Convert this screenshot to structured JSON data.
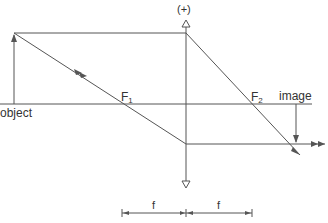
{
  "diagram": {
    "type": "thin-lens ray diagram (converging lens, real inverted image)",
    "colors": {
      "line": "#555555",
      "text": "#333333",
      "background": "#ffffff"
    },
    "lens": {
      "label": "(+)",
      "x": 186,
      "y_top": 20,
      "y_bottom": 186
    },
    "optical_axis": {
      "y": 104,
      "x_start": 0,
      "x_end": 312
    },
    "object": {
      "label": "object",
      "x": 14,
      "y_base": 104,
      "y_tip": 33
    },
    "image": {
      "label": "image",
      "x": 296,
      "y_base": 104,
      "y_tip": 144
    },
    "focal_points": [
      {
        "name": "F",
        "sub": "1",
        "x": 125
      },
      {
        "name": "F",
        "sub": "2",
        "x": 252
      }
    ],
    "rays": [
      {
        "name": "parallel-ray",
        "points": [
          [
            14,
            33
          ],
          [
            186,
            33
          ],
          [
            300,
            155
          ]
        ]
      },
      {
        "name": "focal-ray",
        "points": [
          [
            14,
            33
          ],
          [
            186,
            144
          ],
          [
            325,
            144
          ]
        ]
      }
    ],
    "scale": {
      "y": 213,
      "segments": [
        {
          "label": "f",
          "x_start": 122,
          "x_end": 186
        },
        {
          "label": "f",
          "x_start": 186,
          "x_end": 252
        }
      ]
    }
  }
}
